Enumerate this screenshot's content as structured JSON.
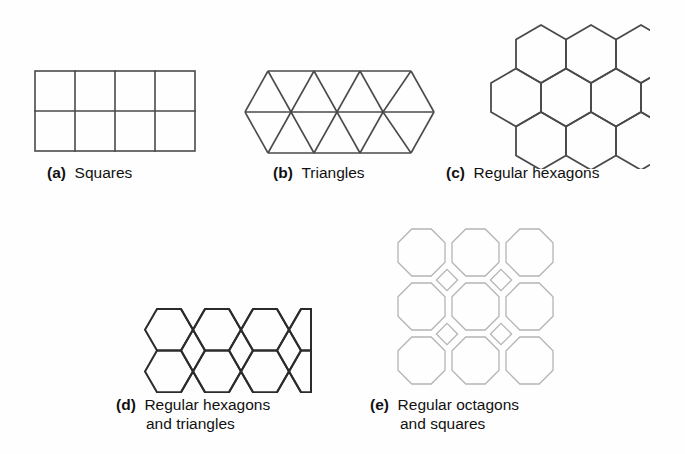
{
  "figure": {
    "background_color": "#fefefe",
    "stroke_dark": "#4a4a4a",
    "stroke_light": "#b4b4b4",
    "text_color": "#111111"
  },
  "panels": [
    {
      "id": "a",
      "tag": "(a)",
      "caption_line1": "Squares",
      "caption_line2": "",
      "tiling": "squares",
      "shape_name": "square",
      "columns": 4,
      "rows": 2,
      "cell_size": 40,
      "stroke": "#4a4a4a",
      "stroke_width": 1.6
    },
    {
      "id": "b",
      "tag": "(b)",
      "caption_line1": "Triangles",
      "caption_line2": "",
      "tiling": "triangles",
      "shape_name": "equilateral-triangle",
      "columns": 4,
      "rows": 2,
      "side": 46,
      "stroke": "#4a4a4a",
      "stroke_width": 1.6
    },
    {
      "id": "c",
      "tag": "(c)",
      "caption_line1": "Regular hexagons",
      "caption_line2": "",
      "tiling": "hexagons",
      "shape_name": "regular-hexagon",
      "orientation": "pointy-top",
      "rows": 3,
      "per_row": [
        3,
        4,
        3
      ],
      "radius": 29,
      "stroke": "#4a4a4a",
      "stroke_width": 1.8
    },
    {
      "id": "d",
      "tag": "(d)",
      "caption_line1": "Regular hexagons",
      "caption_line2": "and triangles",
      "tiling": "hexagons-and-triangles",
      "shape_name": "regular-hexagon + equilateral-triangle",
      "orientation": "flat-top",
      "rows": 2,
      "hexes_per_row": 3,
      "radius": 27,
      "stroke": "#2b2b2b",
      "stroke_width": 2.0
    },
    {
      "id": "e",
      "tag": "(e)",
      "caption_line1": "Regular octagons",
      "caption_line2": "and squares",
      "tiling": "octagons-and-squares",
      "shape_name": "regular-octagon + square",
      "rows": 3,
      "columns": 3,
      "cell_size": 54,
      "stroke": "#b4b4b4",
      "stroke_width": 1.3
    }
  ]
}
